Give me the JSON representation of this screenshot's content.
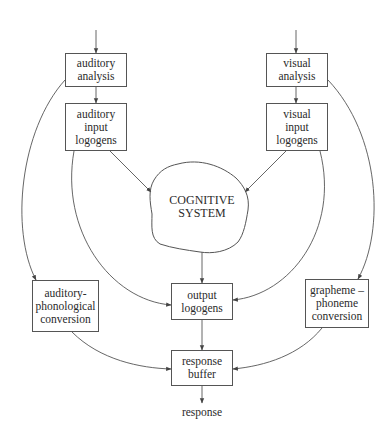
{
  "diagram": {
    "type": "flowchart",
    "nodes": {
      "auditory_analysis": {
        "label": "auditory\nanalysis"
      },
      "auditory_input_logogens": {
        "label": "auditory\ninput\nlogogens"
      },
      "visual_analysis": {
        "label": "visual\nanalysis"
      },
      "visual_input_logogens": {
        "label": "visual\ninput\nlogogens"
      },
      "cognitive_system": {
        "label": "COGNITIVE\nSYSTEM"
      },
      "auditory_phonological_conversion": {
        "label": "auditory-\nphonological\nconversion"
      },
      "output_logogens": {
        "label": "output\nlogogens"
      },
      "grapheme_phoneme_conversion": {
        "label": "grapheme –\nphoneme\nconversion"
      },
      "response_buffer": {
        "label": "response\nbuffer"
      },
      "response": {
        "label": "response"
      }
    },
    "edges": [
      {
        "from": "input",
        "to": "auditory_analysis"
      },
      {
        "from": "input",
        "to": "visual_analysis"
      },
      {
        "from": "auditory_analysis",
        "to": "auditory_input_logogens"
      },
      {
        "from": "visual_analysis",
        "to": "visual_input_logogens"
      },
      {
        "from": "auditory_input_logogens",
        "to": "cognitive_system"
      },
      {
        "from": "visual_input_logogens",
        "to": "cognitive_system"
      },
      {
        "from": "auditory_analysis",
        "to": "auditory_phonological_conversion"
      },
      {
        "from": "visual_analysis",
        "to": "grapheme_phoneme_conversion"
      },
      {
        "from": "auditory_input_logogens",
        "to": "output_logogens"
      },
      {
        "from": "visual_input_logogens",
        "to": "output_logogens"
      },
      {
        "from": "cognitive_system",
        "to": "output_logogens"
      },
      {
        "from": "auditory_phonological_conversion",
        "to": "response_buffer"
      },
      {
        "from": "grapheme_phoneme_conversion",
        "to": "response_buffer"
      },
      {
        "from": "output_logogens",
        "to": "response_buffer"
      },
      {
        "from": "response_buffer",
        "to": "response"
      }
    ]
  },
  "colors": {
    "stroke": "#555555",
    "text": "#2a2a2a",
    "background": "#ffffff"
  }
}
